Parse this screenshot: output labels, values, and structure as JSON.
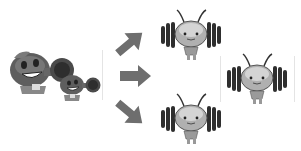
{
  "scene": {
    "description": "Grayscale cartoon diagram: two round peashooter-like characters on the left, three arrows pointing right, three antenna bee-like characters with striped earmuff wings, one isolated on the right in a framed box",
    "colors": {
      "background": "#ffffff",
      "character_dark": "#3a3a3a",
      "character_mid": "#707070",
      "character_light": "#b8b8b8",
      "arrow": "#6e6e6e",
      "divider": "#e4e4e4"
    },
    "left_group": {
      "count": 2,
      "label": ""
    },
    "arrows": [
      {
        "direction": "up-right"
      },
      {
        "direction": "right"
      },
      {
        "direction": "down-right"
      }
    ],
    "middle_characters": {
      "count": 2
    },
    "right_character": {
      "count": 1,
      "framed": true
    }
  }
}
